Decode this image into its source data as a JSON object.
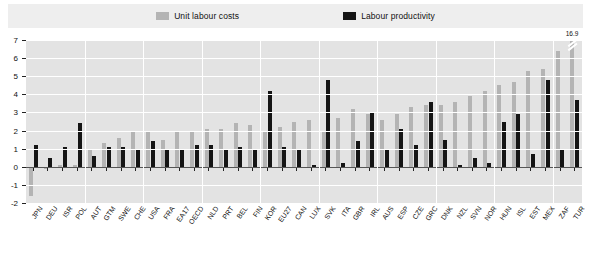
{
  "legend": {
    "items": [
      {
        "label": "Unit labour costs",
        "color": "#b4b4b4",
        "key": "unit_labour_costs"
      },
      {
        "label": "Labour productivity",
        "color": "#151515",
        "key": "labour_productivity"
      }
    ]
  },
  "axis": {
    "y_ticks": [
      "7",
      "6",
      "5",
      "4",
      "3",
      "2",
      "1",
      "0",
      "-1",
      "-2"
    ],
    "y_min": -2,
    "y_max": 7
  },
  "annotations": [
    {
      "text": "16.9",
      "series": "unit_labour_costs",
      "category": "TUR"
    }
  ],
  "chart_data": {
    "type": "bar",
    "title": "",
    "xlabel": "",
    "ylabel": "",
    "ylim": [
      -2,
      7
    ],
    "grid": true,
    "legend_position": "top",
    "categories": [
      "JPN",
      "DEU",
      "ISR",
      "POL",
      "AUT",
      "GTM",
      "SWE",
      "CHE",
      "USA",
      "FRA",
      "EA17",
      "OECD",
      "NLD",
      "PRT",
      "BEL",
      "FIN",
      "KOR",
      "EU27",
      "CAN",
      "LUX",
      "SVK",
      "ITA",
      "GBR",
      "IRL",
      "AUS",
      "ESP",
      "CZE",
      "GRC",
      "DNK",
      "NZL",
      "SVN",
      "NOR",
      "HUN",
      "ISL",
      "EST",
      "MEX",
      "ZAF",
      "TUR"
    ],
    "series": [
      {
        "name": "Unit labour costs",
        "color": "#b4b4b4",
        "values": [
          -1.6,
          -0.1,
          0.1,
          0.1,
          1.0,
          1.3,
          1.6,
          2.0,
          2.0,
          1.5,
          1.9,
          2.0,
          2.1,
          2.1,
          2.4,
          2.3,
          1.9,
          2.2,
          2.5,
          2.6,
          1.9,
          2.7,
          3.2,
          2.9,
          2.6,
          2.9,
          3.3,
          3.4,
          3.4,
          3.6,
          3.9,
          4.2,
          4.5,
          4.7,
          5.3,
          5.4,
          6.4,
          16.9
        ]
      },
      {
        "name": "Labour productivity",
        "color": "#151515",
        "values": [
          1.2,
          0.5,
          1.1,
          2.4,
          0.6,
          1.1,
          1.1,
          1.0,
          1.4,
          1.0,
          1.0,
          1.2,
          1.2,
          1.0,
          1.1,
          0.9,
          4.2,
          1.1,
          1.0,
          0.1,
          4.8,
          0.2,
          1.4,
          3.0,
          1.0,
          2.1,
          1.2,
          3.6,
          1.5,
          0.1,
          0.5,
          0.2,
          2.5,
          2.9,
          0.7,
          4.8,
          0.9,
          3.7
        ]
      }
    ]
  }
}
